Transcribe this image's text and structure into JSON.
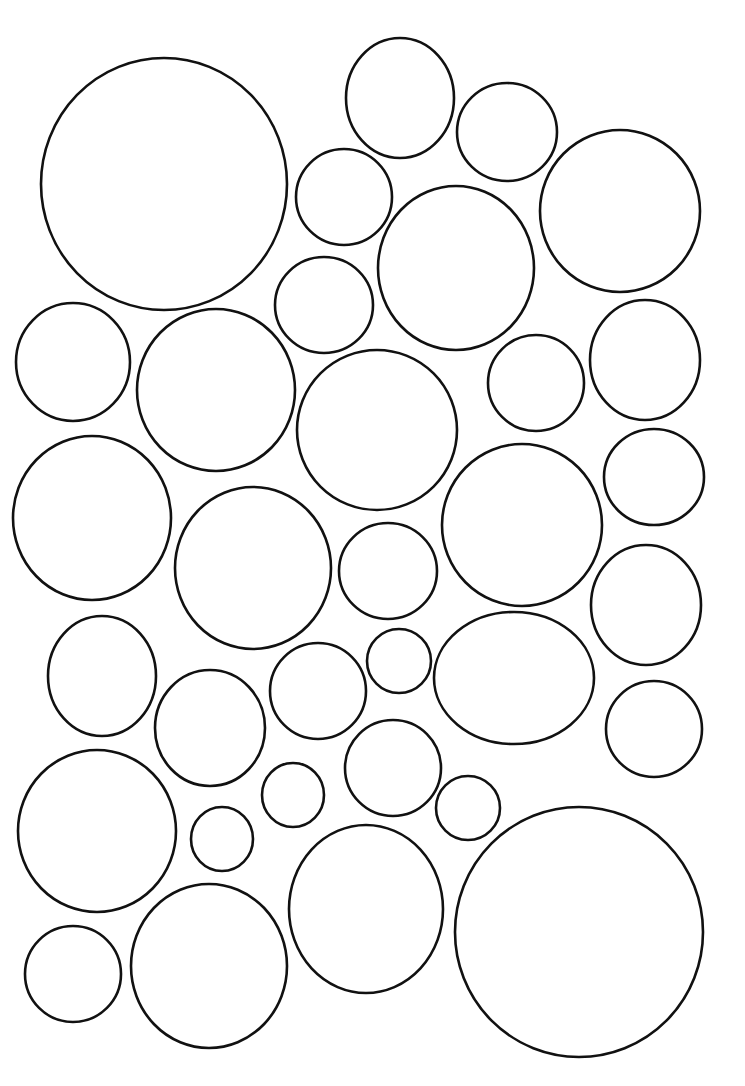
{
  "page": {
    "background": "#ffffff",
    "stroke_color": "#111111"
  },
  "circles": [
    {
      "cx": 164,
      "cy": 184,
      "rx": 123,
      "ry": 126
    },
    {
      "cx": 400,
      "cy": 98,
      "rx": 54,
      "ry": 60
    },
    {
      "cx": 507,
      "cy": 132,
      "rx": 50,
      "ry": 49
    },
    {
      "cx": 620,
      "cy": 211,
      "rx": 80,
      "ry": 81
    },
    {
      "cx": 344,
      "cy": 197,
      "rx": 48,
      "ry": 48
    },
    {
      "cx": 456,
      "cy": 268,
      "rx": 78,
      "ry": 82
    },
    {
      "cx": 324,
      "cy": 305,
      "rx": 49,
      "ry": 48
    },
    {
      "cx": 73,
      "cy": 362,
      "rx": 57,
      "ry": 59
    },
    {
      "cx": 216,
      "cy": 390,
      "rx": 79,
      "ry": 81
    },
    {
      "cx": 377,
      "cy": 430,
      "rx": 80,
      "ry": 80
    },
    {
      "cx": 536,
      "cy": 383,
      "rx": 48,
      "ry": 48
    },
    {
      "cx": 645,
      "cy": 360,
      "rx": 55,
      "ry": 60
    },
    {
      "cx": 92,
      "cy": 518,
      "rx": 79,
      "ry": 82
    },
    {
      "cx": 253,
      "cy": 568,
      "rx": 78,
      "ry": 81
    },
    {
      "cx": 388,
      "cy": 571,
      "rx": 49,
      "ry": 48
    },
    {
      "cx": 522,
      "cy": 525,
      "rx": 80,
      "ry": 81
    },
    {
      "cx": 654,
      "cy": 477,
      "rx": 50,
      "ry": 48
    },
    {
      "cx": 646,
      "cy": 605,
      "rx": 55,
      "ry": 60
    },
    {
      "cx": 102,
      "cy": 676,
      "rx": 54,
      "ry": 60
    },
    {
      "cx": 210,
      "cy": 728,
      "rx": 55,
      "ry": 58
    },
    {
      "cx": 318,
      "cy": 691,
      "rx": 48,
      "ry": 48
    },
    {
      "cx": 399,
      "cy": 661,
      "rx": 32,
      "ry": 32
    },
    {
      "cx": 514,
      "cy": 678,
      "rx": 80,
      "ry": 66
    },
    {
      "cx": 654,
      "cy": 729,
      "rx": 48,
      "ry": 48
    },
    {
      "cx": 97,
      "cy": 831,
      "rx": 79,
      "ry": 81
    },
    {
      "cx": 293,
      "cy": 795,
      "rx": 31,
      "ry": 32
    },
    {
      "cx": 393,
      "cy": 768,
      "rx": 48,
      "ry": 48
    },
    {
      "cx": 468,
      "cy": 808,
      "rx": 32,
      "ry": 32
    },
    {
      "cx": 222,
      "cy": 839,
      "rx": 31,
      "ry": 32
    },
    {
      "cx": 366,
      "cy": 909,
      "rx": 77,
      "ry": 84
    },
    {
      "cx": 579,
      "cy": 932,
      "rx": 124,
      "ry": 125
    },
    {
      "cx": 73,
      "cy": 974,
      "rx": 48,
      "ry": 48
    },
    {
      "cx": 209,
      "cy": 966,
      "rx": 78,
      "ry": 82
    }
  ]
}
